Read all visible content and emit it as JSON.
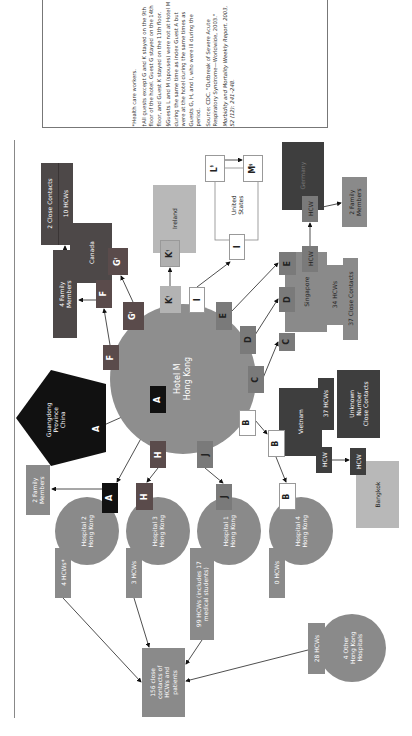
{
  "colors": {
    "hotel": "#8e8e8e",
    "hospital": "#8a8a8a",
    "dark": "#3e3e3e",
    "canada": "#4d4848",
    "black": "#111111",
    "light": "#b5b5b5",
    "singapore": "#8a8a8a",
    "white": "#ffffff"
  },
  "notes": {
    "health_care": "*Health care workers.",
    "guests_floor": "†All guests except G and K stayed on the 9th floor of the hotel. Guest G stayed on the 14th floor, and Guest K stayed on the 11th floor.",
    "guests_lm": "§Guests L and M (spouses) were not at Hotel M during the same time as index Guest A but were at the hotel during the same times as Guests G, H, and I, who were ill during the period.",
    "source": "Source: CDC. \"Outbreak of Severe Acute Respiratory Syndrome—Worldwide, 2003.\"",
    "citation": "Morbidity and Mortality Weekly Report. 2003, 52 (12): 241–248."
  },
  "hub": {
    "line1": "Hotel M",
    "line2": "Hong Kong"
  },
  "guangdong": {
    "line1": "Guangdong",
    "line2": "Province",
    "line3": "China",
    "guest": "A"
  },
  "hotel_guests": {
    "A": "A",
    "F": "F",
    "G": "G",
    "K": "K",
    "I": "I",
    "E": "E",
    "D": "D",
    "C": "C",
    "B": "B",
    "H": "H",
    "J": "J",
    "dagger": "†"
  },
  "canada": {
    "name": "Canada",
    "guest_f": "F",
    "guest_g": "G",
    "family": {
      "line1": "4 Family",
      "line2": "Members"
    },
    "close_contacts": "2 Close Contacts",
    "hcws": "10 HCWs"
  },
  "ireland": {
    "name": "Ireland",
    "guest": "K"
  },
  "united_states": {
    "line1": "United",
    "line2": "States",
    "guest_i": "I",
    "guest_l": "L",
    "guest_m": "M",
    "section": "§"
  },
  "singapore": {
    "name": "Singapore",
    "guests": [
      "C",
      "D",
      "E"
    ],
    "hcw": "HCW",
    "hcws": "34 HCWs",
    "close_contacts": "37 Close Contacts"
  },
  "germany": {
    "name": "Germany",
    "hcw": "HCW",
    "family": {
      "line1": "2 Family",
      "line2": "Members"
    }
  },
  "vietnam": {
    "name": "Vietnam",
    "guest": "B",
    "hcws": "37 HCWs",
    "unknown": {
      "line1": "Unknown",
      "line2": "Number",
      "line3": "Close Contacts"
    },
    "hcw": "HCW"
  },
  "bangkok": {
    "name": "Bangkok",
    "hcw": "HCW"
  },
  "hospitals": [
    {
      "line1": "Hospital 2",
      "line2": "Hong Kong",
      "guest": "A",
      "hcws": "4 HCWs*"
    },
    {
      "line1": "Hospital 3",
      "line2": "Hong Kong",
      "guest": "H",
      "hcws": "3 HCWs"
    },
    {
      "line1": "Hospital 1",
      "line2": "Hong Kong",
      "guest": "J",
      "hcws_line1": "99 HCWs (includes 17",
      "hcws_line2": "medical students)"
    },
    {
      "line1": "Hospital 4",
      "line2": "Hong Kong",
      "guest": "B",
      "hcws": "0 HCWs"
    }
  ],
  "family_left": {
    "line1": "2 Family",
    "line2": "Members"
  },
  "close_contacts_total": {
    "line1": "156 close",
    "line2": "contacts of",
    "line3": "HCWs and",
    "line4": "patients"
  },
  "other_hospitals": {
    "line1": "4 Other",
    "line2": "Hong Kong",
    "line3": "Hospitals",
    "hcws": "28 HCWs"
  }
}
